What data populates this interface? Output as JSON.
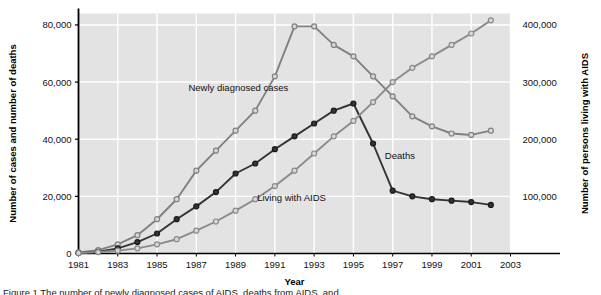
{
  "figure": {
    "caption": "Figure 1  The number of newly diagnosed cases of AIDS, deaths from AIDS, and"
  },
  "chart_data": {
    "type": "line",
    "title": "",
    "xlabel": "Year",
    "ylabel": "Number of cases and number of deaths",
    "ylabel_right": "Number of persons living with AIDS",
    "grid": true,
    "legend": "inline-labels",
    "plot_background": "#e3e3e3",
    "x": [
      1981,
      1982,
      1983,
      1984,
      1985,
      1986,
      1987,
      1988,
      1989,
      1990,
      1991,
      1992,
      1993,
      1994,
      1995,
      1996,
      1997,
      1998,
      1999,
      2000,
      2001,
      2002
    ],
    "xlim": [
      1981,
      2003
    ],
    "xticks": [
      1981,
      1983,
      1985,
      1987,
      1989,
      1991,
      1993,
      1995,
      1997,
      1999,
      2001,
      2003
    ],
    "xtick_labels": [
      "1981",
      "1983",
      "1985",
      "1987",
      "1989",
      "1991",
      "1993",
      "1995",
      "1997",
      "1999",
      "2001",
      "2003"
    ],
    "ylim": [
      0,
      84000
    ],
    "yticks": [
      0,
      20000,
      40000,
      60000,
      80000
    ],
    "ytick_labels": [
      "0",
      "20,000",
      "40,000",
      "60,000",
      "80,000"
    ],
    "ylim_right": [
      0,
      420000
    ],
    "yticks_right": [
      100000,
      200000,
      300000,
      400000
    ],
    "ytick_right_labels": [
      "100,000",
      "200,000",
      "300,000",
      "400,000"
    ],
    "series": [
      {
        "name": "Newly diagnosed cases",
        "axis": "left",
        "color": "#808080",
        "marker": "circle-open",
        "label_x": 1986.6,
        "label_y": 57000,
        "values": [
          400,
          1200,
          3200,
          6400,
          12000,
          19000,
          29000,
          36000,
          43000,
          50000,
          62000,
          79500,
          79500,
          73000,
          69000,
          62000,
          55000,
          48000,
          44500,
          42000,
          41500,
          43000
        ]
      },
      {
        "name": "Deaths",
        "axis": "left",
        "color": "#333333",
        "marker": "circle-filled",
        "label_x": 1996.6,
        "label_y": 33000,
        "values": [
          200,
          600,
          1800,
          4000,
          7000,
          12000,
          16500,
          21500,
          28000,
          31500,
          36500,
          41000,
          45500,
          50000,
          52500,
          38500,
          22000,
          20000,
          19000,
          18500,
          18000,
          17000
        ]
      },
      {
        "name": "Living with AIDS",
        "axis": "right",
        "color": "#8a8a8a",
        "marker": "circle-open",
        "label_x": 1990.1,
        "label_y": 92000,
        "values": [
          900,
          2500,
          5000,
          9000,
          16000,
          25000,
          40000,
          56000,
          75000,
          95000,
          118000,
          145000,
          175000,
          205000,
          232000,
          265000,
          300000,
          325000,
          345000,
          365000,
          385000,
          408000
        ]
      }
    ]
  }
}
